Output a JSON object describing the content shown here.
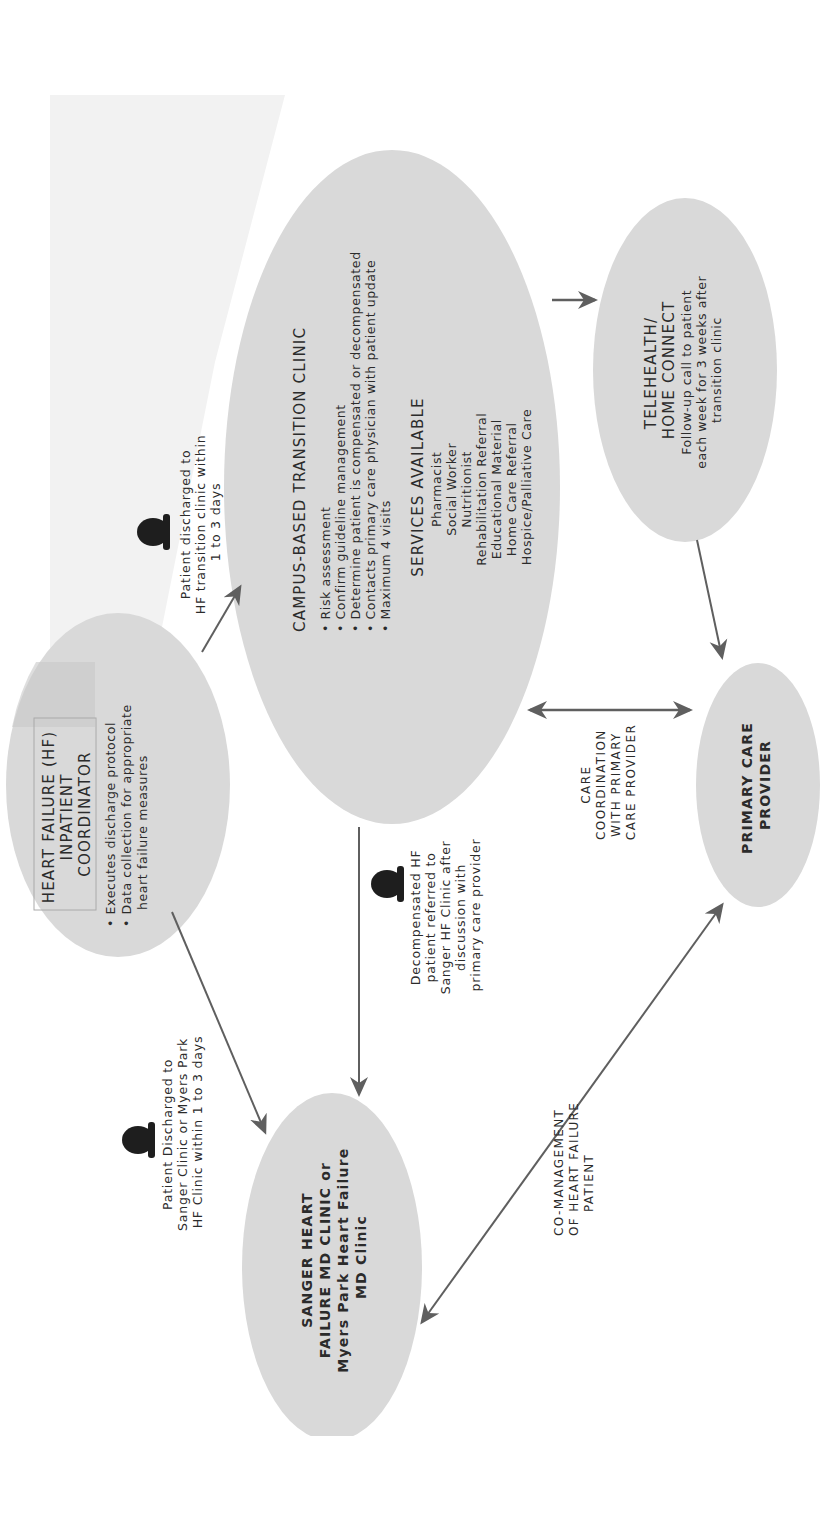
{
  "orientation": "rotated 90 degrees counter-clockwise",
  "colors": {
    "node_fill": "#d9d9d9",
    "arrow": "#5f5f5f",
    "text": "#2b2b2b",
    "faded_background": "#f2f2f2",
    "coordinator_header_box": "#c8c8c8"
  },
  "nodes": {
    "coordinator": {
      "title_lines": [
        "HEART FAILURE (HF)",
        "INPATIENT",
        "COORDINATOR"
      ],
      "bullets": [
        "Executes discharge protocol",
        "Data collection for appropriate",
        "heart failure measures"
      ]
    },
    "transition_clinic": {
      "title": "CAMPUS-BASED TRANSITION CLINIC",
      "bullets": [
        "Risk assessment",
        "Confirm guideline management",
        "Determine patient is compensated or decompensated",
        "Contacts primary care physician with patient update",
        "Maximum 4 visits"
      ],
      "services_title": "SERVICES AVAILABLE",
      "services": [
        "Pharmacist",
        "Social Worker",
        "Nutritionist",
        "Rehabilitation Referral",
        "Educational Material",
        "Home Care Referral",
        "Hospice/Palliative Care"
      ]
    },
    "telehealth": {
      "title_lines": [
        "TELEHEALTH/",
        "HOME CONNECT"
      ],
      "body_lines": [
        "Follow-up call to patient",
        "each week for 3 weeks after",
        "transition clinic"
      ]
    },
    "primary_care": {
      "title_lines": [
        "PRIMARY CARE",
        "PROVIDER"
      ]
    },
    "sanger_clinic": {
      "title_lines": [
        "SANGER HEART",
        "FAILURE MD CLINIC or",
        "Myers Park Heart Failure",
        "MD Clinic"
      ]
    }
  },
  "edge_labels": {
    "to_transition": [
      "Patient discharged to",
      "HF transition clinic within",
      "1 to 3 days"
    ],
    "to_sanger": [
      "Patient Discharged to",
      "Sanger Clinic or Myers Park",
      "HF Clinic within 1 to 3 days"
    ],
    "decompensated": [
      "Decompensated HF",
      "patient referred to",
      "Sanger HF Clinic after",
      "discussion with",
      "primary care provider"
    ],
    "care_coordination": [
      "CARE",
      "COORDINATION",
      "WITH PRIMARY",
      "CARE PROVIDER"
    ],
    "co_management": [
      "CO-MANAGEMENT",
      "OF HEART FAILURE",
      "PATIENT"
    ]
  },
  "icons": {
    "patient_icon": "person-silhouette"
  }
}
